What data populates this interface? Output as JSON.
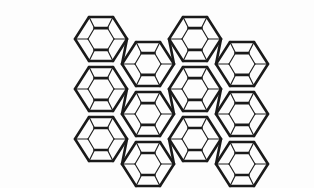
{
  "figure": {
    "kind": "line-diagram",
    "title": "",
    "caption": "",
    "background_color": "#fdfdfd",
    "line_color": "#1a1a1a",
    "thick_stroke_width": 2.6,
    "thin_stroke_width": 1.15,
    "canvas": {
      "width": 314,
      "height": 188
    },
    "bounds": {
      "x_min": 78,
      "y_min": 14,
      "x_max": 266,
      "y_max": 168
    }
  },
  "lattice": {
    "columns": 4,
    "rows": 3,
    "x_step": 47,
    "y_step": 50,
    "x_origin": 101,
    "y_origin": 39,
    "row_offset_x": 0,
    "stagger": "column-alternating",
    "odd_column_y_shift": 25
  },
  "cage_unit": {
    "name": "hexagonal-prism-cage",
    "outer_vertices": 6,
    "inner_vertices": 6,
    "connector_faces": 6,
    "outer_radius_x": 26,
    "outer_radius_y": 25,
    "inner_radius_x": 13,
    "inner_radius_y": 11.5
  },
  "chart_data": {
    "type": "scatter",
    "title": "",
    "xlabel": "",
    "ylabel": "",
    "grid": false,
    "legend": null,
    "categories": [],
    "values": []
  }
}
